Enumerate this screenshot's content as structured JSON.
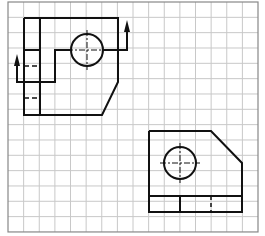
{
  "figure": {
    "grid": {
      "x0": 8,
      "y0": 2,
      "cols": 16,
      "rows": 15,
      "cell_w": 15.625,
      "cell_h": 15.33,
      "line_color": "#c8c8c8",
      "frame_color": "#888888"
    },
    "stroke_color": "#111111",
    "views": [
      {
        "name": "top-view-with-section-line"
      },
      {
        "name": "front-view"
      }
    ]
  }
}
